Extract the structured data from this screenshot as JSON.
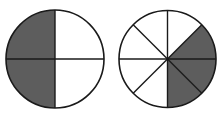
{
  "figure": {
    "colors": {
      "shaded": "#5d5d5d",
      "unshaded": "#ffffff",
      "stroke": "#1a1a1a"
    },
    "circles": [
      {
        "name": "quarters-circle",
        "parts": 4,
        "shaded_parts": 2,
        "fraction": "2/4",
        "shaded_sectors": [
          "top-left",
          "bottom-left"
        ]
      },
      {
        "name": "eighths-circle",
        "parts": 8,
        "shaded_parts": 3,
        "fraction": "3/8",
        "shaded_sectors": [
          "right-upper",
          "right-lower",
          "bottom-right"
        ]
      }
    ]
  }
}
